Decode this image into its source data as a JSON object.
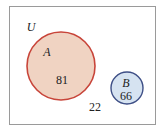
{
  "diagram": {
    "type": "venn",
    "universe": {
      "label": "U"
    },
    "sets": [
      {
        "label": "A",
        "value": "81",
        "fill": "#f0d3c2",
        "stroke": "#c8453a"
      },
      {
        "label": "B",
        "value": "66",
        "fill": "#d6e3f1",
        "stroke": "#3e4f86"
      }
    ],
    "outside_value": "22",
    "frame_color": "#9a9a9a"
  }
}
